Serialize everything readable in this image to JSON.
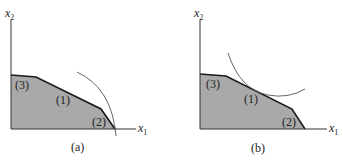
{
  "figure": {
    "panels": [
      {
        "id": "a",
        "caption": "(a)",
        "x_axis_label": "x",
        "x_axis_sub": "1",
        "y_axis_label": "x",
        "y_axis_sub": "2",
        "regions": [
          "(1)",
          "(2)",
          "(3)"
        ],
        "description": "Feasible region with objective contour (dashed arc) touching corner between constraints (1) and (2) on the x1 axis"
      },
      {
        "id": "b",
        "caption": "(b)",
        "x_axis_label": "x",
        "x_axis_sub": "1",
        "y_axis_label": "x",
        "y_axis_sub": "2",
        "regions": [
          "(1)",
          "(2)",
          "(3)"
        ],
        "description": "Feasible region with objective contour (curve) tangent to constraint (1)"
      }
    ],
    "colors": {
      "region_fill": "#a9a9a9",
      "boundary": "#1a1a1a",
      "axis": "#333333",
      "contour": "#555555"
    }
  }
}
